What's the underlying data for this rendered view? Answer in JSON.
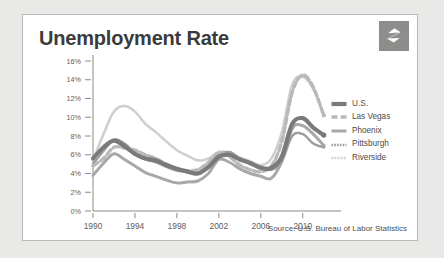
{
  "card": {
    "title": "Unemployment Rate",
    "source": "Source: U.S. Bureau of Labor Statistics",
    "logo_icon": "zillow-z-logo-icon"
  },
  "colors": {
    "us": "#7a7a7c",
    "las_vegas": "#b9b9bb",
    "phoenix": "#a8a8aa",
    "pittsburgh": "#9b9b9d",
    "riverside": "#cfcfd1",
    "axis": "#8a8a8c",
    "text": "#4a4a4c",
    "title": "#3b3b3d",
    "card_bg": "#ffffff",
    "page_bg": "#e9e9e7",
    "logo_bg": "#8d8d8b"
  },
  "chart_data": {
    "type": "line",
    "title": "Unemployment Rate",
    "xlabel": "",
    "ylabel": "",
    "xlim": [
      1990,
      2012.5
    ],
    "ylim": [
      0,
      16
    ],
    "ytick_labels": [
      "16%",
      "14%",
      "12%",
      "10%",
      "8%",
      "6%",
      "4%",
      "2%",
      "0%"
    ],
    "ytick_values": [
      16,
      14,
      12,
      10,
      8,
      6,
      4,
      2,
      0
    ],
    "xtick_labels": [
      "1990",
      "1994",
      "1998",
      "2002",
      "2006",
      "2010"
    ],
    "xtick_values": [
      1990,
      1994,
      1998,
      2002,
      2006,
      2010
    ],
    "grid": false,
    "legend_position": "right",
    "x": [
      1990,
      1991,
      1992,
      1993,
      1994,
      1995,
      1996,
      1997,
      1998,
      1999,
      2000,
      2001,
      2002,
      2003,
      2004,
      2005,
      2006,
      2007,
      2008,
      2009,
      2010,
      2011,
      2012
    ],
    "series": [
      {
        "name": "U.S.",
        "style": "solid-thick",
        "color": "#7a7a7c",
        "values": [
          5.6,
          6.8,
          7.5,
          6.9,
          6.1,
          5.6,
          5.4,
          4.9,
          4.5,
          4.2,
          4.0,
          4.7,
          5.8,
          6.0,
          5.5,
          5.1,
          4.6,
          4.6,
          5.8,
          9.3,
          9.9,
          8.9,
          8.1
        ]
      },
      {
        "name": "Las Vegas",
        "style": "dashed",
        "color": "#b9b9bb",
        "values": [
          4.8,
          5.6,
          6.8,
          6.7,
          6.5,
          6.0,
          5.6,
          5.0,
          4.5,
          4.3,
          4.4,
          5.2,
          6.2,
          5.8,
          4.9,
          4.4,
          4.2,
          4.8,
          7.4,
          12.7,
          14.5,
          13.2,
          10.2
        ]
      },
      {
        "name": "Phoenix",
        "style": "solid",
        "color": "#a8a8aa",
        "values": [
          3.8,
          5.1,
          6.1,
          5.5,
          4.8,
          4.1,
          3.7,
          3.3,
          3.0,
          3.1,
          3.2,
          4.0,
          5.5,
          5.2,
          4.5,
          4.0,
          3.7,
          3.5,
          5.3,
          8.8,
          9.1,
          8.2,
          7.0
        ]
      },
      {
        "name": "Pittsburgh",
        "style": "wavy",
        "color": "#9b9b9d",
        "values": [
          5.0,
          6.4,
          7.6,
          7.2,
          6.2,
          5.5,
          5.2,
          4.7,
          4.3,
          4.2,
          4.1,
          4.6,
          5.9,
          6.3,
          5.6,
          5.1,
          4.7,
          4.4,
          5.3,
          8.0,
          8.2,
          7.2,
          6.8
        ]
      },
      {
        "name": "Riverside",
        "style": "wavy-light",
        "color": "#cfcfd1",
        "values": [
          5.4,
          8.2,
          10.6,
          11.2,
          10.6,
          9.3,
          8.4,
          7.4,
          6.5,
          5.9,
          5.4,
          5.6,
          6.3,
          6.2,
          5.7,
          5.3,
          4.9,
          5.6,
          8.4,
          13.5,
          14.3,
          13.0,
          10.2
        ]
      }
    ]
  },
  "legend": [
    {
      "label": "U.S.",
      "swatch": "solid-thick-swatch"
    },
    {
      "label": "Las Vegas",
      "swatch": "dashed-swatch"
    },
    {
      "label": "Phoenix",
      "swatch": "solid-swatch"
    },
    {
      "label": "Pittsburgh",
      "swatch": "wavy-swatch"
    },
    {
      "label": "Riverside",
      "swatch": "wavy-light-swatch"
    }
  ]
}
